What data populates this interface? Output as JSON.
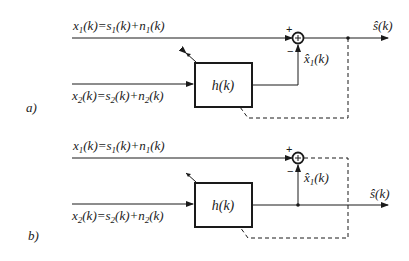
{
  "figure": {
    "panels": [
      {
        "id": "a",
        "label": "a)",
        "input1_label": "x1(k)=s1(k)+n1(k)",
        "input2_label": "x2(k)=s2(k)+n2(k)",
        "filter_label": "h(k)",
        "estimate_label": "x̂1(k)",
        "output_label": "ŝ(k)",
        "plus_sign": "+",
        "minus_sign": "−",
        "feedback_source": "output of summing junction (error signal)"
      },
      {
        "id": "b",
        "label": "b)",
        "input1_label": "x1(k)=s1(k)+n1(k)",
        "input2_label": "x2(k)=s2(k)+n2(k)",
        "filter_label": "h(k)",
        "estimate_label": "x̂1(k)",
        "output_label": "ŝ(k)",
        "plus_sign": "+",
        "minus_sign": "−",
        "feedback_source": "output of summing junction; system output taken from filter output"
      }
    ],
    "colors": {
      "stroke": "#1a1a1a",
      "background": "#ffffff"
    }
  }
}
